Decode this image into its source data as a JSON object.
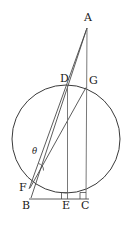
{
  "figure": {
    "type": "geometry-diagram",
    "canvas": {
      "width": 132,
      "height": 229
    },
    "stroke_color": "#3a3a3a",
    "label_color": "#1a1a1a",
    "background_color": "#ffffff"
  },
  "circle": {
    "name": "main-circle",
    "cx": 66,
    "cy": 139,
    "r": 54,
    "stroke": "#3a3a3a",
    "stroke_width": 1
  },
  "points": [
    {
      "id": "A",
      "label": "A",
      "x": 87,
      "y": 28,
      "label_x": 84,
      "label_y": 12
    },
    {
      "id": "D",
      "label": "D",
      "x": 67.5,
      "y": 85.5,
      "label_x": 60,
      "label_y": 73
    },
    {
      "id": "G",
      "label": "G",
      "x": 86,
      "y": 87.5,
      "label_x": 89,
      "label_y": 75
    },
    {
      "id": "F",
      "label": "F",
      "x": 30,
      "y": 187,
      "label_x": 19,
      "label_y": 182
    },
    {
      "id": "B",
      "label": "B",
      "x": 30,
      "y": 199,
      "label_x": 22,
      "label_y": 200
    },
    {
      "id": "E",
      "label": "E",
      "x": 67.5,
      "y": 199,
      "label_x": 62,
      "label_y": 200
    },
    {
      "id": "C",
      "label": "C",
      "x": 86,
      "y": 199,
      "label_x": 81,
      "label_y": 200
    }
  ],
  "segments": [
    {
      "id": "A-F",
      "from": "A",
      "to": "F",
      "note": "apex to F through D"
    },
    {
      "id": "A-B",
      "from": "A",
      "to": "B",
      "note": "apex down to B"
    },
    {
      "id": "A-C",
      "from": "A",
      "to": "C",
      "note": "apex down through G to C"
    },
    {
      "id": "F-G",
      "from": "F",
      "to": "G",
      "note": "chord from F to G"
    },
    {
      "id": "D-E",
      "from": "D",
      "to": "E",
      "note": "vertical altitude"
    },
    {
      "id": "G-C",
      "from": "G",
      "to": "C",
      "note": "vertical altitude"
    },
    {
      "id": "B-C",
      "from": "B",
      "to": "C",
      "note": "baseline"
    }
  ],
  "angle_marks": [
    {
      "id": "theta",
      "label": "θ",
      "label_x": 32,
      "label_y": 147,
      "vertex": "F-apex",
      "arc_cx": 41,
      "arc_cy": 167
    }
  ],
  "right_angles": [
    {
      "id": "right-angle-E",
      "at": "E",
      "x": 62,
      "y": 192,
      "size": 7
    },
    {
      "id": "right-angle-C",
      "at": "C",
      "x": 80,
      "y": 192,
      "size": 7
    }
  ]
}
